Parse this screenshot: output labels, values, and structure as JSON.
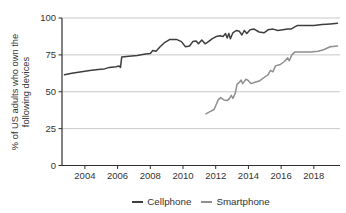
{
  "chart_data": {
    "type": "line",
    "title": "",
    "xlabel": "",
    "ylabel": "% of US adults who own the following devices",
    "xlim": [
      2002.6,
      2019.6
    ],
    "ylim": [
      0,
      100
    ],
    "yticks": [
      0,
      25,
      50,
      75,
      100
    ],
    "xticks": [
      2004,
      2006,
      2008,
      2010,
      2012,
      2014,
      2016,
      2018
    ],
    "grid": "horizontal",
    "legend_position": "bottom",
    "colors": {
      "axis": "#2f2f2f",
      "grid": "#c9c9c9",
      "text": "#333333",
      "background": "#ffffff"
    },
    "series": [
      {
        "name": "Cellphone",
        "color": "#3e3e3e",
        "points": [
          [
            2002.75,
            61.5
          ],
          [
            2003.2,
            62.5
          ],
          [
            2003.8,
            63.5
          ],
          [
            2004.3,
            64.5
          ],
          [
            2004.8,
            65
          ],
          [
            2005.2,
            65.5
          ],
          [
            2005.5,
            66.5
          ],
          [
            2005.9,
            67
          ],
          [
            2006.1,
            67.5
          ],
          [
            2006.18,
            66.5
          ],
          [
            2006.25,
            73.5
          ],
          [
            2006.7,
            74
          ],
          [
            2007.2,
            74.5
          ],
          [
            2007.7,
            75.5
          ],
          [
            2008.0,
            76
          ],
          [
            2008.15,
            78
          ],
          [
            2008.35,
            77.5
          ],
          [
            2008.6,
            80.5
          ],
          [
            2008.9,
            83.5
          ],
          [
            2009.2,
            85.5
          ],
          [
            2009.6,
            85.5
          ],
          [
            2009.9,
            84
          ],
          [
            2010.15,
            80.5
          ],
          [
            2010.4,
            81
          ],
          [
            2010.6,
            84
          ],
          [
            2010.8,
            84.5
          ],
          [
            2010.95,
            82.5
          ],
          [
            2011.15,
            85
          ],
          [
            2011.35,
            82.5
          ],
          [
            2011.55,
            84
          ],
          [
            2011.8,
            86
          ],
          [
            2012.05,
            87.5
          ],
          [
            2012.25,
            88
          ],
          [
            2012.45,
            87.5
          ],
          [
            2012.6,
            89.5
          ],
          [
            2012.7,
            86.5
          ],
          [
            2012.8,
            89.5
          ],
          [
            2012.9,
            86
          ],
          [
            2013.05,
            90
          ],
          [
            2013.25,
            91.5
          ],
          [
            2013.45,
            91
          ],
          [
            2013.6,
            88.5
          ],
          [
            2013.75,
            91.5
          ],
          [
            2013.9,
            89.5
          ],
          [
            2014.1,
            92
          ],
          [
            2014.35,
            92.5
          ],
          [
            2014.65,
            90.5
          ],
          [
            2014.95,
            90
          ],
          [
            2015.2,
            92
          ],
          [
            2015.5,
            92.5
          ],
          [
            2015.8,
            91.5
          ],
          [
            2016.1,
            92
          ],
          [
            2016.4,
            92.5
          ],
          [
            2016.6,
            92.5
          ],
          [
            2017.0,
            95
          ],
          [
            2017.5,
            95
          ],
          [
            2018.0,
            95
          ],
          [
            2018.5,
            95.5
          ],
          [
            2019.0,
            96
          ],
          [
            2019.45,
            96.5
          ]
        ]
      },
      {
        "name": "Smartphone",
        "color": "#8f8f8f",
        "points": [
          [
            2011.4,
            35
          ],
          [
            2011.65,
            36.5
          ],
          [
            2011.9,
            38
          ],
          [
            2012.0,
            40.5
          ],
          [
            2012.15,
            44.5
          ],
          [
            2012.3,
            46
          ],
          [
            2012.5,
            44.5
          ],
          [
            2012.7,
            44
          ],
          [
            2012.85,
            45.5
          ],
          [
            2012.95,
            47.5
          ],
          [
            2013.05,
            45.5
          ],
          [
            2013.2,
            49
          ],
          [
            2013.3,
            55
          ],
          [
            2013.45,
            56.5
          ],
          [
            2013.55,
            58
          ],
          [
            2013.65,
            55.5
          ],
          [
            2013.85,
            58.5
          ],
          [
            2014.0,
            57.5
          ],
          [
            2014.15,
            55.5
          ],
          [
            2014.4,
            56.5
          ],
          [
            2014.7,
            57.5
          ],
          [
            2015.0,
            60
          ],
          [
            2015.2,
            61.5
          ],
          [
            2015.35,
            64.5
          ],
          [
            2015.5,
            63.5
          ],
          [
            2015.65,
            67.5
          ],
          [
            2015.95,
            68.5
          ],
          [
            2016.2,
            70.5
          ],
          [
            2016.4,
            73
          ],
          [
            2016.5,
            71
          ],
          [
            2016.65,
            75
          ],
          [
            2016.85,
            77
          ],
          [
            2017.3,
            77
          ],
          [
            2017.8,
            77
          ],
          [
            2018.25,
            77.5
          ],
          [
            2018.6,
            78.5
          ],
          [
            2019.0,
            80.5
          ],
          [
            2019.45,
            81
          ]
        ]
      }
    ]
  }
}
